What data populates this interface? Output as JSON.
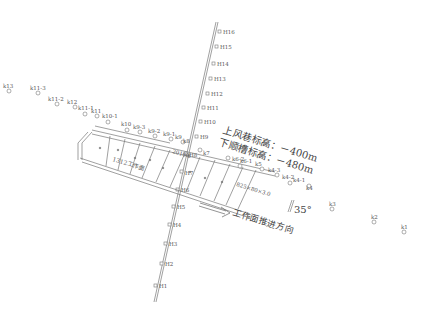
{
  "diagram": {
    "title_lines": {
      "upper_airway": "上风巷标高：－400m",
      "lower_airway": "下顺槽标高：－480m"
    },
    "advance_direction": "工作面推进方向",
    "dip_angle": "35°",
    "face_label": "1312工作面",
    "face_dims": "825×80×3.0",
    "face_code": "2010年",
    "line_h_labels": [
      "H1",
      "H2",
      "H3",
      "H4",
      "H5",
      "H6",
      "H7",
      "H8",
      "H9",
      "H10",
      "H11",
      "H12",
      "H13",
      "H14",
      "H15",
      "H16"
    ],
    "line_k_labels": {
      "k13": "k13",
      "k11_3": "k11-3",
      "k11_2": "k11-2",
      "k12": "k12",
      "k11_1": "k11-1",
      "k11": "k11",
      "k10_1": "k10-1",
      "k10": "k10",
      "k9_3": "k9-3",
      "k9_2": "k9-2",
      "k9_1": "k9-1",
      "k9": "k9",
      "k8": "k8",
      "k7": "k7",
      "k6_2": "k6-2",
      "k6_1": "k6-1",
      "k5": "k5",
      "k4_3": "k4-3",
      "k4_2": "k4-2",
      "k4_1": "k4-1",
      "k4": "k4",
      "k3": "k3",
      "k2": "k2",
      "k1": "k1"
    },
    "colors": {
      "line": "#777777",
      "text": "#555555"
    }
  }
}
